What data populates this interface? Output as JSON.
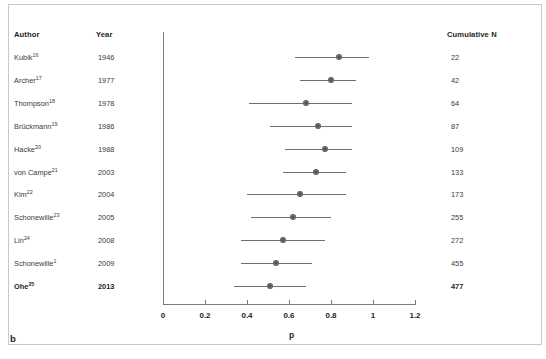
{
  "panel_label": "b",
  "columns": {
    "author": "Author",
    "year": "Year",
    "cumulative_n": "Cumulative N"
  },
  "rows": [
    {
      "author": "Kubik",
      "ref": "16",
      "year": "1946",
      "cumulative_n": "22",
      "bold": false
    },
    {
      "author": "Archer",
      "ref": "17",
      "year": "1977",
      "cumulative_n": "42",
      "bold": false
    },
    {
      "author": "Thompson",
      "ref": "18",
      "year": "1978",
      "cumulative_n": "64",
      "bold": false
    },
    {
      "author": "Brückmann",
      "ref": "19",
      "year": "1986",
      "cumulative_n": "87",
      "bold": false
    },
    {
      "author": "Hacke",
      "ref": "20",
      "year": "1988",
      "cumulative_n": "109",
      "bold": false
    },
    {
      "author": "von Campe",
      "ref": "21",
      "year": "2003",
      "cumulative_n": "133",
      "bold": false
    },
    {
      "author": "Kim",
      "ref": "22",
      "year": "2004",
      "cumulative_n": "173",
      "bold": false
    },
    {
      "author": "Schonewille",
      "ref": "23",
      "year": "2005",
      "cumulative_n": "255",
      "bold": false
    },
    {
      "author": "Lin",
      "ref": "24",
      "year": "2008",
      "cumulative_n": "272",
      "bold": false
    },
    {
      "author": "Schonewille",
      "ref": "1",
      "year": "2009",
      "cumulative_n": "455",
      "bold": false
    },
    {
      "author": "Ohe",
      "ref": "25",
      "year": "2013",
      "cumulative_n": "477",
      "bold": true
    }
  ],
  "chart_data": {
    "type": "scatter",
    "subtype": "forest-plot",
    "title": "",
    "xlabel": "p",
    "ylabel": "",
    "xlim": [
      0,
      1.2
    ],
    "xticks": [
      0,
      0.2,
      0.4,
      0.6,
      0.8,
      1,
      1.2
    ],
    "xticklabels": [
      "0",
      "0.2",
      "0.4",
      "0.6",
      "0.8",
      "1",
      "1.2"
    ],
    "grid": false,
    "legend": "none",
    "marker_color": "#767676",
    "line_color": "#6f6f6f",
    "axis_color": "#7b7b7b",
    "categories": [
      "Kubik 1946",
      "Archer 1977",
      "Thompson 1978",
      "Brückmann 1986",
      "Hacke 1988",
      "von Campe 2003",
      "Kim 2004",
      "Schonewille 2005",
      "Lin 2008",
      "Schonewille 2009",
      "Ohe 2013"
    ],
    "points": [
      {
        "label": "Kubik 1946",
        "estimate": 0.84,
        "ci_low": 0.63,
        "ci_high": 0.98
      },
      {
        "label": "Archer 1977",
        "estimate": 0.8,
        "ci_low": 0.65,
        "ci_high": 0.92
      },
      {
        "label": "Thompson 1978",
        "estimate": 0.68,
        "ci_low": 0.41,
        "ci_high": 0.9
      },
      {
        "label": "Brückmann 1986",
        "estimate": 0.74,
        "ci_low": 0.51,
        "ci_high": 0.9
      },
      {
        "label": "Hacke 1988",
        "estimate": 0.77,
        "ci_low": 0.58,
        "ci_high": 0.9
      },
      {
        "label": "von Campe 2003",
        "estimate": 0.73,
        "ci_low": 0.57,
        "ci_high": 0.87
      },
      {
        "label": "Kim 2004",
        "estimate": 0.65,
        "ci_low": 0.4,
        "ci_high": 0.87
      },
      {
        "label": "Schonewille 2005",
        "estimate": 0.62,
        "ci_low": 0.42,
        "ci_high": 0.8
      },
      {
        "label": "Lin 2008",
        "estimate": 0.57,
        "ci_low": 0.37,
        "ci_high": 0.77
      },
      {
        "label": "Schonewille 2009",
        "estimate": 0.54,
        "ci_low": 0.37,
        "ci_high": 0.71
      },
      {
        "label": "Ohe 2013",
        "estimate": 0.51,
        "ci_low": 0.34,
        "ci_high": 0.68
      }
    ]
  },
  "geometry": {
    "x0_px": 163,
    "x_per_unit_px": 210,
    "row0_center_y_px": 57,
    "row_step_px": 22.9
  }
}
